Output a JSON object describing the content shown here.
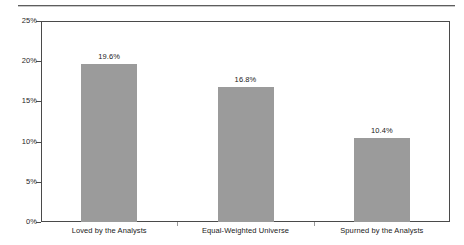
{
  "chart_data": {
    "type": "bar",
    "title": "",
    "subtitle": "",
    "xlabel": "",
    "ylabel": "",
    "categories": [
      "Loved by the Analysts",
      "Equal-Weighted Universe",
      "Spurned by the Analysts"
    ],
    "values": [
      19.6,
      16.8,
      10.4
    ],
    "value_labels": [
      "19.6%",
      "16.8%",
      "10.4%"
    ],
    "ylim": [
      0,
      25
    ],
    "ytick_values": [
      0,
      5,
      10,
      15,
      20,
      25
    ],
    "ytick_labels": [
      "0%",
      "5%",
      "10%",
      "15%",
      "20%",
      "25%"
    ],
    "grid": false,
    "legend": false,
    "legend_position": "none",
    "bar_color": "#9b9b9b",
    "axis_color": "#4a4a4a",
    "text_color": "#1a1a1a"
  },
  "decorations": {
    "top_rule_color": "#5d5d5d"
  }
}
